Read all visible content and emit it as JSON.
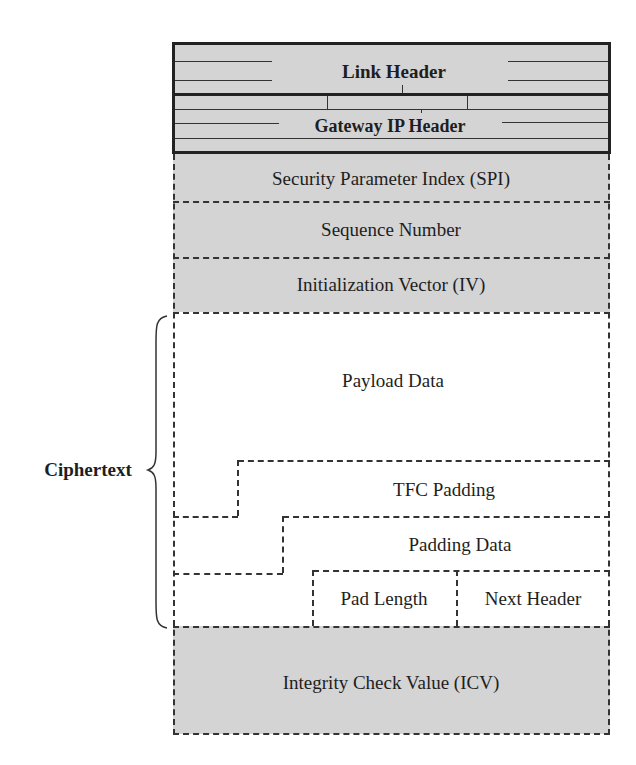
{
  "diagram": {
    "colors": {
      "field_fill": "#d4d4d4",
      "line": "#222222",
      "background": "#ffffff"
    },
    "outer_headers": [
      {
        "id": "link-header",
        "label": "Link Header"
      },
      {
        "id": "gateway-ip-header",
        "label": "Gateway IP Header"
      }
    ],
    "esp_fields": {
      "spi": "Security Parameter Index (SPI)",
      "sequence": "Sequence Number",
      "iv": "Initialization Vector (IV)",
      "payload": "Payload Data",
      "tfc_padding": "TFC Padding",
      "padding": "Padding Data",
      "pad_length": "Pad Length",
      "next_header": "Next Header",
      "icv": "Integrity Check Value (ICV)"
    },
    "brace": {
      "label": "Ciphertext",
      "spans": [
        "Payload Data",
        "TFC Padding",
        "Padding Data",
        "Pad Length",
        "Next Header"
      ]
    }
  }
}
